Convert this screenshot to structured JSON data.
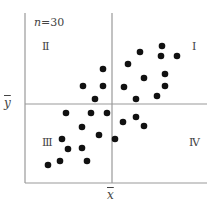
{
  "chart_data": {
    "type": "scatter",
    "title": "",
    "annotation": "n=30",
    "n": 30,
    "xlabel": "x̄",
    "ylabel": "ȳ",
    "xlim": [
      0,
      100
    ],
    "ylim": [
      0,
      100
    ],
    "mean_lines": {
      "x_mean": 50,
      "y_mean": 50
    },
    "quadrant_labels": {
      "I": "Ⅰ",
      "II": "Ⅱ",
      "III": "Ⅲ",
      "IV": "Ⅳ"
    },
    "grid": false,
    "axes": [
      "left",
      "bottom"
    ],
    "points_px": [
      [
        162,
        46
      ],
      [
        140,
        52
      ],
      [
        161,
        56
      ],
      [
        177,
        56
      ],
      [
        128,
        64
      ],
      [
        165,
        74
      ],
      [
        144,
        78
      ],
      [
        124,
        87
      ],
      [
        165,
        86
      ],
      [
        136,
        99
      ],
      [
        157,
        96
      ],
      [
        103,
        69
      ],
      [
        83,
        86
      ],
      [
        103,
        86
      ],
      [
        95,
        99
      ],
      [
        66,
        113
      ],
      [
        91,
        113
      ],
      [
        107,
        113
      ],
      [
        82,
        127
      ],
      [
        99,
        135
      ],
      [
        62,
        139
      ],
      [
        68,
        149
      ],
      [
        82,
        148
      ],
      [
        60,
        161
      ],
      [
        87,
        161
      ],
      [
        48,
        165
      ],
      [
        123,
        122
      ],
      [
        136,
        117
      ],
      [
        144,
        126
      ],
      [
        115,
        139
      ]
    ],
    "frame_px": {
      "left": 25,
      "right": 207,
      "top": 13,
      "bottom": 183,
      "mean_x": 112,
      "mean_y": 104
    }
  },
  "labels": {
    "n_var": "n",
    "n_value": "=30",
    "q1": "Ⅰ",
    "q2": "Ⅱ",
    "q3": "Ⅲ",
    "q4": "Ⅳ",
    "y_mean": "y",
    "x_mean": "x"
  },
  "colors": {
    "axis": "#999999",
    "point": "#111111",
    "text": "#444444"
  }
}
